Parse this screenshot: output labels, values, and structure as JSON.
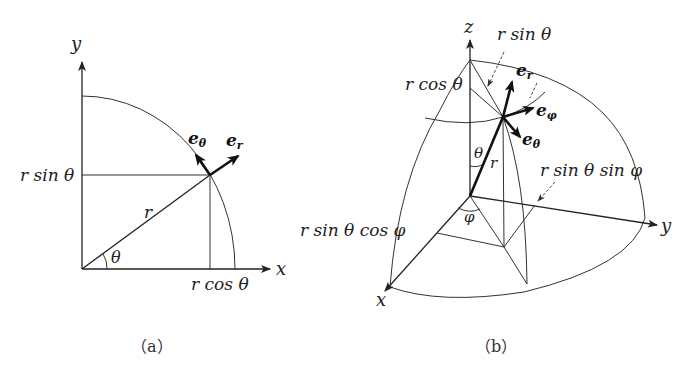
{
  "figure": {
    "panel_a": {
      "caption": "（a）",
      "axes": {
        "x": "x",
        "y": "y"
      },
      "labels": {
        "r": "r",
        "theta": "θ",
        "r_sin_theta": "r sin θ",
        "r_cos_theta": "r cos θ",
        "e_theta": "e",
        "e_theta_sub": "θ",
        "e_r": "e",
        "e_r_sub": "r"
      }
    },
    "panel_b": {
      "caption": "（b）",
      "axes": {
        "x": "x",
        "y": "y",
        "z": "z"
      },
      "labels": {
        "r": "r",
        "theta": "θ",
        "phi": "φ",
        "r_sin_theta": "r sin θ",
        "r_cos_theta": "r cos θ",
        "r_sin_theta_sin_phi": "r sin θ sin φ",
        "r_sin_theta_cos_phi": "r sin θ cos φ",
        "e_r": "e",
        "e_r_sub": "r",
        "e_phi": "e",
        "e_phi_sub": "φ",
        "e_theta": "e",
        "e_theta_sub": "θ"
      }
    }
  }
}
